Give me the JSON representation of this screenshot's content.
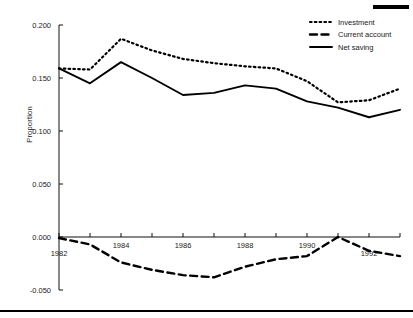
{
  "decorations": {
    "top_bar": "top-right-black-bar",
    "bottom_rule": "bottom-black-rule"
  },
  "axes": {
    "ylabel": "Proportion",
    "yticks": [
      "0.200",
      "0.150",
      "0.100",
      "0.050",
      "0.000",
      "-0.050"
    ],
    "ytick_values": [
      0.2,
      0.15,
      0.1,
      0.05,
      0.0,
      -0.05
    ],
    "xticks": [
      "1982",
      "1984",
      "1986",
      "1988",
      "1990",
      "1992"
    ],
    "xtick_values": [
      1982,
      1984,
      1986,
      1988,
      1990,
      1992
    ]
  },
  "legend": {
    "position": "top-right",
    "items": [
      {
        "label": "Investment",
        "style": "dotted"
      },
      {
        "label": "Current account",
        "style": "dashed"
      },
      {
        "label": "Net saving",
        "style": "solid"
      }
    ]
  },
  "chart_data": {
    "type": "line",
    "title": "",
    "xlabel": "",
    "ylabel": "Proportion",
    "xlim": [
      1982,
      1993
    ],
    "ylim": [
      -0.05,
      0.2
    ],
    "grid": false,
    "legend_position": "top-right",
    "x": [
      1982,
      1983,
      1984,
      1985,
      1986,
      1987,
      1988,
      1989,
      1990,
      1991,
      1992,
      1993
    ],
    "series": [
      {
        "name": "Investment",
        "style": "dotted",
        "color": "#000000",
        "values": [
          0.159,
          0.158,
          0.187,
          0.176,
          0.168,
          0.164,
          0.161,
          0.159,
          0.147,
          0.127,
          0.129,
          0.14
        ]
      },
      {
        "name": "Current account",
        "style": "dashed",
        "color": "#000000",
        "values": [
          -0.001,
          -0.007,
          -0.024,
          -0.031,
          -0.036,
          -0.038,
          -0.028,
          -0.021,
          -0.018,
          0.0,
          -0.013,
          -0.018
        ]
      },
      {
        "name": "Net saving",
        "style": "solid",
        "color": "#000000",
        "values": [
          0.159,
          0.145,
          0.165,
          0.15,
          0.134,
          0.136,
          0.143,
          0.14,
          0.128,
          0.122,
          0.113,
          0.12
        ]
      }
    ]
  }
}
